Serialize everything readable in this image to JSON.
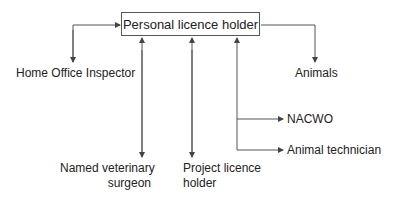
{
  "diagram": {
    "type": "flow",
    "center_node": {
      "label": "Personal licence holder"
    },
    "nodes": [
      {
        "id": "home_office",
        "label": "Home Office Inspector",
        "direction": "bidirectional"
      },
      {
        "id": "animals",
        "label": "Animals",
        "direction": "outgoing"
      },
      {
        "id": "nacwo",
        "label": "NACWO",
        "direction": "bidirectional"
      },
      {
        "id": "animal_tech",
        "label": "Animal technician",
        "direction": "bidirectional"
      },
      {
        "id": "nvs",
        "label_line1": "Named veterinary",
        "label_line2": "surgeon",
        "direction": "bidirectional"
      },
      {
        "id": "project",
        "label_line1": "Project licence",
        "label_line2": "holder",
        "direction": "bidirectional"
      }
    ]
  },
  "colors": {
    "line": "#444444",
    "text": "#222222",
    "background": "#ffffff"
  }
}
